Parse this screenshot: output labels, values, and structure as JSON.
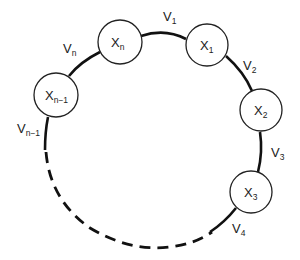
{
  "diagram": {
    "type": "ring",
    "nodes": [
      {
        "id": "xn",
        "label": "X",
        "sub": "n"
      },
      {
        "id": "x1",
        "label": "X",
        "sub": "1"
      },
      {
        "id": "x2",
        "label": "X",
        "sub": "2"
      },
      {
        "id": "x3",
        "label": "X",
        "sub": "3"
      },
      {
        "id": "xn1",
        "label": "X",
        "sub": "n−1"
      }
    ],
    "edges": [
      {
        "id": "v1",
        "label": "V",
        "sub": "1",
        "from": "xn",
        "to": "x1",
        "style": "solid"
      },
      {
        "id": "v2",
        "label": "V",
        "sub": "2",
        "from": "x1",
        "to": "x2",
        "style": "solid"
      },
      {
        "id": "v3",
        "label": "V",
        "sub": "3",
        "from": "x2",
        "to": "x3",
        "style": "solid"
      },
      {
        "id": "v4",
        "label": "V",
        "sub": "4",
        "from": "x3",
        "to": "...",
        "style": "dashed"
      },
      {
        "id": "vn1",
        "label": "V",
        "sub": "n−1",
        "from": "...",
        "to": "xn1",
        "style": "dashed"
      },
      {
        "id": "vn",
        "label": "V",
        "sub": "n",
        "from": "xn1",
        "to": "xn",
        "style": "solid"
      }
    ]
  }
}
